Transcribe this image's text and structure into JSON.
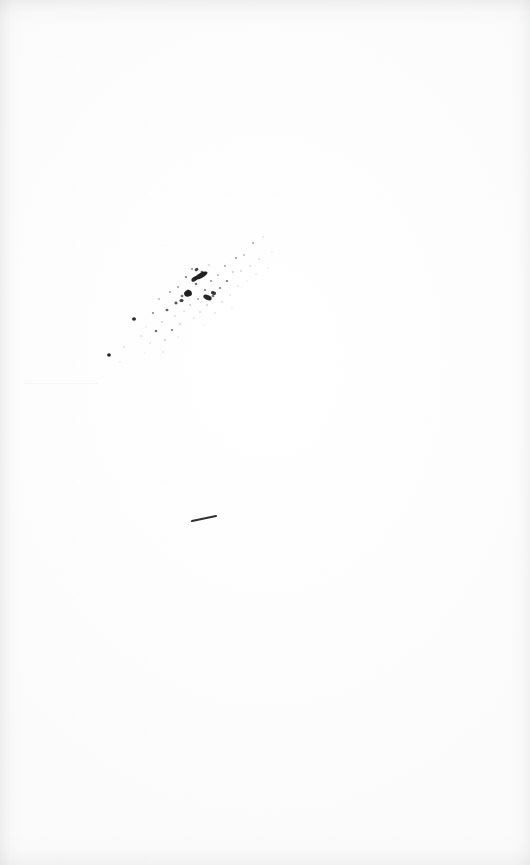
{
  "page": {
    "kind": "scanned-blank-page",
    "width": 530,
    "height": 865,
    "paper_color": "#fdfdfd",
    "ink_color": "#1a1a1a",
    "caption": ""
  },
  "artifacts": {
    "ink_spatter": {
      "name": "ink-spatter-cluster",
      "orientation": "diagonal lower-left to upper-right",
      "bounds": {
        "x": 100,
        "y": 232,
        "width": 175,
        "height": 130
      },
      "dense_core": {
        "x": 182,
        "y": 262,
        "width": 45,
        "height": 45
      },
      "droplets": [
        {
          "cx": 109.0,
          "cy": 355.0,
          "rx": 1.9,
          "ry": 1.7,
          "a": 0.95
        },
        {
          "cx": 124.0,
          "cy": 347.0,
          "rx": 0.7,
          "ry": 0.7,
          "a": 0.3
        },
        {
          "cx": 134.0,
          "cy": 319.0,
          "rx": 2.0,
          "ry": 1.8,
          "a": 0.92
        },
        {
          "cx": 141.0,
          "cy": 336.0,
          "rx": 0.8,
          "ry": 0.8,
          "a": 0.28
        },
        {
          "cx": 146.0,
          "cy": 327.0,
          "rx": 0.6,
          "ry": 0.6,
          "a": 0.22
        },
        {
          "cx": 150.0,
          "cy": 343.0,
          "rx": 0.7,
          "ry": 0.7,
          "a": 0.24
        },
        {
          "cx": 153.0,
          "cy": 313.0,
          "rx": 1.1,
          "ry": 1.0,
          "a": 0.5
        },
        {
          "cx": 156.0,
          "cy": 331.0,
          "rx": 1.3,
          "ry": 1.2,
          "a": 0.62
        },
        {
          "cx": 159.0,
          "cy": 299.0,
          "rx": 0.9,
          "ry": 0.9,
          "a": 0.35
        },
        {
          "cx": 162.0,
          "cy": 322.0,
          "rx": 0.8,
          "ry": 0.8,
          "a": 0.3
        },
        {
          "cx": 165.0,
          "cy": 340.0,
          "rx": 0.9,
          "ry": 0.8,
          "a": 0.33
        },
        {
          "cx": 167.0,
          "cy": 310.0,
          "rx": 1.5,
          "ry": 1.3,
          "a": 0.7
        },
        {
          "cx": 170.0,
          "cy": 292.0,
          "rx": 1.0,
          "ry": 0.9,
          "a": 0.42
        },
        {
          "cx": 172.0,
          "cy": 330.0,
          "rx": 1.2,
          "ry": 1.1,
          "a": 0.55
        },
        {
          "cx": 175.0,
          "cy": 316.0,
          "rx": 0.8,
          "ry": 0.8,
          "a": 0.28
        },
        {
          "cx": 176.0,
          "cy": 303.0,
          "rx": 1.6,
          "ry": 1.4,
          "a": 0.72
        },
        {
          "cx": 178.0,
          "cy": 287.0,
          "rx": 1.0,
          "ry": 0.9,
          "a": 0.45
        },
        {
          "cx": 180.0,
          "cy": 324.0,
          "rx": 0.9,
          "ry": 0.8,
          "a": 0.32
        },
        {
          "cx": 182.0,
          "cy": 296.0,
          "rx": 1.4,
          "ry": 1.2,
          "a": 0.6
        },
        {
          "cx": 184.0,
          "cy": 311.0,
          "rx": 0.7,
          "ry": 0.7,
          "a": 0.26
        },
        {
          "cx": 186.0,
          "cy": 277.0,
          "rx": 1.2,
          "ry": 1.1,
          "a": 0.55
        },
        {
          "cx": 188.0,
          "cy": 291.0,
          "rx": 1.8,
          "ry": 1.5,
          "a": 0.8
        },
        {
          "cx": 190.0,
          "cy": 305.0,
          "rx": 0.9,
          "ry": 0.8,
          "a": 0.34
        },
        {
          "cx": 192.0,
          "cy": 269.0,
          "rx": 1.1,
          "ry": 1.0,
          "a": 0.48
        },
        {
          "cx": 194.0,
          "cy": 318.0,
          "rx": 0.7,
          "ry": 0.7,
          "a": 0.24
        },
        {
          "cx": 196.0,
          "cy": 284.0,
          "rx": 1.3,
          "ry": 1.2,
          "a": 0.58
        },
        {
          "cx": 198.0,
          "cy": 299.0,
          "rx": 1.0,
          "ry": 0.9,
          "a": 0.4
        },
        {
          "cx": 200.0,
          "cy": 312.0,
          "rx": 0.8,
          "ry": 0.8,
          "a": 0.28
        },
        {
          "cx": 202.0,
          "cy": 272.0,
          "rx": 1.5,
          "ry": 1.3,
          "a": 0.66
        },
        {
          "cx": 205.0,
          "cy": 290.0,
          "rx": 1.2,
          "ry": 1.1,
          "a": 0.52
        },
        {
          "cx": 207.0,
          "cy": 305.0,
          "rx": 0.9,
          "ry": 0.8,
          "a": 0.33
        },
        {
          "cx": 209.0,
          "cy": 265.0,
          "rx": 0.8,
          "ry": 0.8,
          "a": 0.3
        },
        {
          "cx": 211.0,
          "cy": 281.0,
          "rx": 1.1,
          "ry": 1.0,
          "a": 0.46
        },
        {
          "cx": 213.0,
          "cy": 296.0,
          "rx": 1.4,
          "ry": 1.2,
          "a": 0.6
        },
        {
          "cx": 215.0,
          "cy": 313.0,
          "rx": 0.7,
          "ry": 0.7,
          "a": 0.24
        },
        {
          "cx": 218.0,
          "cy": 275.0,
          "rx": 0.9,
          "ry": 0.9,
          "a": 0.36
        },
        {
          "cx": 220.0,
          "cy": 288.0,
          "rx": 1.2,
          "ry": 1.1,
          "a": 0.52
        },
        {
          "cx": 222.0,
          "cy": 302.0,
          "rx": 0.8,
          "ry": 0.8,
          "a": 0.28
        },
        {
          "cx": 225.0,
          "cy": 266.0,
          "rx": 1.0,
          "ry": 0.9,
          "a": 0.4
        },
        {
          "cx": 227.0,
          "cy": 281.0,
          "rx": 1.3,
          "ry": 1.1,
          "a": 0.55
        },
        {
          "cx": 230.0,
          "cy": 295.0,
          "rx": 0.7,
          "ry": 0.7,
          "a": 0.24
        },
        {
          "cx": 233.0,
          "cy": 272.0,
          "rx": 0.9,
          "ry": 0.8,
          "a": 0.34
        },
        {
          "cx": 236.0,
          "cy": 258.0,
          "rx": 1.1,
          "ry": 1.0,
          "a": 0.44
        },
        {
          "cx": 238.0,
          "cy": 286.0,
          "rx": 0.7,
          "ry": 0.7,
          "a": 0.22
        },
        {
          "cx": 241.0,
          "cy": 271.0,
          "rx": 0.8,
          "ry": 0.8,
          "a": 0.28
        },
        {
          "cx": 244.0,
          "cy": 255.0,
          "rx": 0.9,
          "ry": 0.9,
          "a": 0.34
        },
        {
          "cx": 247.0,
          "cy": 281.0,
          "rx": 0.6,
          "ry": 0.6,
          "a": 0.2
        },
        {
          "cx": 250.0,
          "cy": 266.0,
          "rx": 0.8,
          "ry": 0.8,
          "a": 0.27
        },
        {
          "cx": 253.0,
          "cy": 243.0,
          "rx": 1.0,
          "ry": 0.9,
          "a": 0.38
        },
        {
          "cx": 256.0,
          "cy": 274.0,
          "rx": 0.7,
          "ry": 0.7,
          "a": 0.22
        },
        {
          "cx": 259.0,
          "cy": 259.0,
          "rx": 0.8,
          "ry": 0.8,
          "a": 0.26
        },
        {
          "cx": 263.0,
          "cy": 237.0,
          "rx": 0.7,
          "ry": 0.7,
          "a": 0.22
        },
        {
          "cx": 268.0,
          "cy": 268.0,
          "rx": 0.6,
          "ry": 0.6,
          "a": 0.18
        },
        {
          "cx": 272.0,
          "cy": 252.0,
          "rx": 0.6,
          "ry": 0.6,
          "a": 0.18
        },
        {
          "cx": 120.0,
          "cy": 362.0,
          "rx": 0.6,
          "ry": 0.6,
          "a": 0.18
        },
        {
          "cx": 145.0,
          "cy": 353.0,
          "rx": 0.6,
          "ry": 0.6,
          "a": 0.16
        },
        {
          "cx": 163.0,
          "cy": 352.0,
          "rx": 0.7,
          "ry": 0.7,
          "a": 0.2
        },
        {
          "cx": 178.0,
          "cy": 337.0,
          "rx": 0.6,
          "ry": 0.6,
          "a": 0.18
        },
        {
          "cx": 204.0,
          "cy": 325.0,
          "rx": 0.6,
          "ry": 0.6,
          "a": 0.16
        },
        {
          "cx": 232.0,
          "cy": 308.0,
          "rx": 0.6,
          "ry": 0.6,
          "a": 0.15
        }
      ],
      "blots": [
        {
          "cx": 201.0,
          "cy": 275.5,
          "rx": 7.2,
          "ry": 2.6,
          "rot": -28,
          "a": 0.97
        },
        {
          "cx": 194.5,
          "cy": 279.0,
          "rx": 3.4,
          "ry": 2.2,
          "rot": -34,
          "a": 0.95
        },
        {
          "cx": 188.0,
          "cy": 293.5,
          "rx": 4.0,
          "ry": 3.1,
          "rot": -12,
          "a": 0.97
        },
        {
          "cx": 207.5,
          "cy": 297.5,
          "rx": 4.4,
          "ry": 2.4,
          "rot": 22,
          "a": 0.94
        },
        {
          "cx": 213.5,
          "cy": 293.0,
          "rx": 2.6,
          "ry": 1.9,
          "rot": 15,
          "a": 0.88
        },
        {
          "cx": 181.5,
          "cy": 300.5,
          "rx": 2.1,
          "ry": 1.6,
          "rot": 0,
          "a": 0.85
        },
        {
          "cx": 196.5,
          "cy": 269.5,
          "rx": 2.0,
          "ry": 1.5,
          "rot": -40,
          "a": 0.8
        }
      ]
    },
    "pen_dash": {
      "name": "pen-dash-stroke",
      "x1": 192,
      "y1": 521,
      "x2": 216,
      "y2": 516,
      "thickness": 2.1
    },
    "faint_lines": [
      {
        "name": "faint-impression-line",
        "x": 24,
        "y": 383,
        "width": 74,
        "opacity": 0.055
      }
    ]
  }
}
